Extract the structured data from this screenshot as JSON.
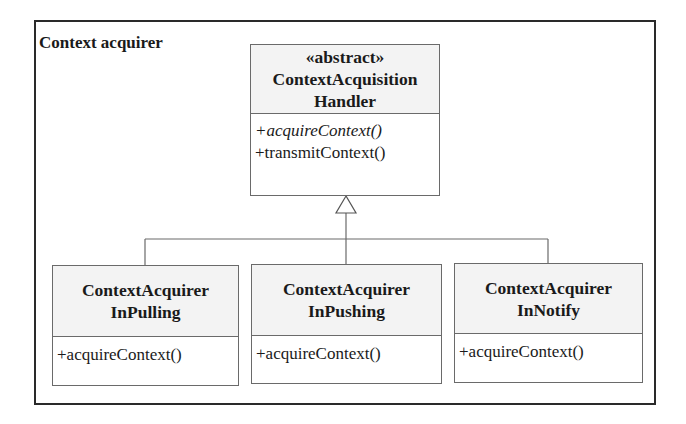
{
  "package": {
    "title": "Context acquirer"
  },
  "parent": {
    "stereotype": "«abstract»",
    "name_lines": [
      "ContextAcquisition",
      "Handler"
    ],
    "operations": [
      {
        "text": "+acquireContext()",
        "abstract": true
      },
      {
        "text": "+transmitContext()",
        "abstract": false
      }
    ]
  },
  "children": [
    {
      "name_lines": [
        "ContextAcquirer",
        "InPulling"
      ],
      "operations": [
        "+acquireContext()"
      ]
    },
    {
      "name_lines": [
        "ContextAcquirer",
        "InPushing"
      ],
      "operations": [
        "+acquireContext()"
      ]
    },
    {
      "name_lines": [
        "ContextAcquirer",
        "InNotify"
      ],
      "operations": [
        "+acquireContext()"
      ]
    }
  ],
  "relationship": {
    "type": "generalization",
    "label": ""
  },
  "colors": {
    "frame": "#2a2a2a",
    "box_border": "#6a6a6a",
    "header_fill": "#f3f3f3",
    "text": "#1a1a1a"
  }
}
